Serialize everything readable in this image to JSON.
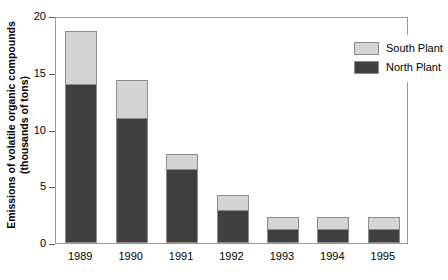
{
  "chart_data": {
    "type": "bar",
    "subtype": "stacked-bar",
    "title": "",
    "xlabel": "",
    "ylabel": "Emissions of volatile organic compounds (thousands of tons)",
    "ylabel_line1": "Emissions of volatile organic compounds",
    "ylabel_line2": "(thousands of tons)",
    "categories": [
      "1989",
      "1990",
      "1991",
      "1992",
      "1993",
      "1994",
      "1995"
    ],
    "series": [
      {
        "name": "North Plant",
        "color": "#404040",
        "values": [
          14.0,
          11.0,
          6.5,
          2.9,
          1.2,
          1.2,
          1.2
        ]
      },
      {
        "name": "South Plant",
        "color": "#d4d4d4",
        "values": [
          4.7,
          3.4,
          1.3,
          1.3,
          1.1,
          1.1,
          1.1
        ]
      }
    ],
    "totals": [
      18.7,
      14.4,
      7.8,
      4.2,
      2.3,
      2.3,
      2.3
    ],
    "ylim": [
      0,
      20
    ],
    "yticks": [
      0,
      5,
      10,
      15,
      20
    ],
    "ytick_labels": [
      "0",
      "5",
      "10",
      "15",
      "20"
    ],
    "grid": false,
    "legend_position": "top-right",
    "stack_order": [
      "North Plant",
      "South Plant"
    ]
  },
  "legend": {
    "entries": [
      {
        "label": "South Plant",
        "swatch": "legend-swatch-south",
        "color": "#d4d4d4"
      },
      {
        "label": "North Plant",
        "swatch": "legend-swatch-north",
        "color": "#404040"
      }
    ]
  },
  "colors": {
    "north_plant": "#404040",
    "south_plant": "#d4d4d4",
    "axis": "#5b5b5b",
    "frame": "#9a9a9a",
    "background": "#ffffff"
  }
}
